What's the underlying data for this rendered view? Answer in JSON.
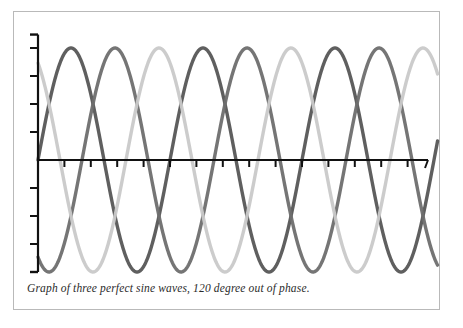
{
  "figure": {
    "caption": "Graph of three perfect sine waves, 120 degree out of phase.",
    "background_color": "#ffffff",
    "border_color": "#b9b9b9",
    "axis_color": "#111111"
  },
  "chart_data": {
    "type": "line",
    "title": "",
    "subtitle": "",
    "xlabel": "",
    "ylabel": "",
    "annotations": [
      "Graph of three perfect sine waves, 120 degree out of phase."
    ],
    "grid": false,
    "legend": "none",
    "xlim": [
      0,
      1080
    ],
    "ylim": [
      -1.15,
      1.15
    ],
    "x_unit": "degrees",
    "period_degrees": 360,
    "amplitude": 1.0,
    "phase_offset_degrees": 120,
    "x_axis": {
      "tick_count": 15,
      "tick_step_degrees": 72,
      "tick_direction": "down",
      "ticks": [
        0,
        72,
        144,
        216,
        288,
        360,
        432,
        504,
        576,
        648,
        720,
        792,
        864,
        936,
        1008
      ],
      "tick_labels": []
    },
    "y_axis": {
      "tick_count": 8,
      "tick_direction": "left",
      "ticks": [
        -1.0,
        -0.75,
        -0.5,
        -0.25,
        0.25,
        0.5,
        0.75,
        1.0
      ],
      "tick_labels": []
    },
    "series": [
      {
        "name": "wave-1",
        "color": "#565656",
        "phase_degrees": 0,
        "start_value": 0.0,
        "peaks_degrees": [
          90,
          450,
          810
        ],
        "troughs_degrees": [
          270,
          630,
          990
        ],
        "values_at": {
          "0": 0.0,
          "90": 1.0,
          "180": 0.0,
          "270": -1.0,
          "360": 0.0
        }
      },
      {
        "name": "wave-2",
        "color": "#6e6e6e",
        "phase_degrees": -120,
        "start_value": -0.866,
        "peaks_degrees": [
          210,
          570,
          930
        ],
        "troughs_degrees": [
          30,
          390,
          750
        ],
        "values_at": {
          "0": -0.866,
          "210": 1.0,
          "30": -1.0,
          "120": 0.0,
          "300": 0.0
        }
      },
      {
        "name": "wave-3",
        "color": "#c9c9c9",
        "phase_degrees": 120,
        "start_value": 0.866,
        "peaks_degrees": [
          -30,
          330,
          690,
          1050
        ],
        "troughs_degrees": [
          150,
          510,
          870
        ],
        "values_at": {
          "0": 0.866,
          "330": 1.0,
          "150": -1.0,
          "60": 0.0,
          "240": 0.0
        }
      }
    ]
  }
}
